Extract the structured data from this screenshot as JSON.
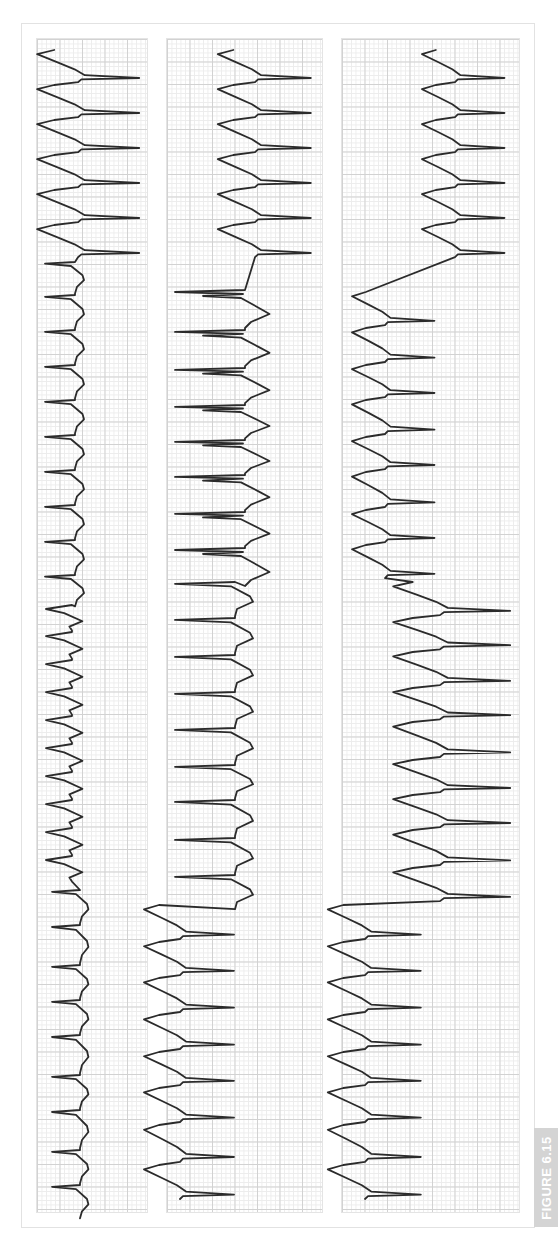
{
  "figure": {
    "label": "FIGURE 6.15",
    "label_bg": "#d4d4d4",
    "trace_color": "#2b2b2b",
    "grid_major_color": "#d2d2d2",
    "grid_minor_color": "#ececec"
  },
  "chart_data": {
    "type": "line",
    "title": "",
    "grid": true,
    "strips": [
      {
        "name": "strip-1",
        "x_range": [
          36,
          148
        ],
        "segments": [
          {
            "shape": "wide-right",
            "base": 78,
            "amp": 68,
            "beats": [
              50,
              85,
              120,
              155,
              190,
              225
            ]
          },
          {
            "shape": "mixed-left",
            "base": 75,
            "amp": -30,
            "beats": [
              262,
              295,
              330,
              365,
              400,
              435,
              470,
              505,
              540,
              575
            ]
          },
          {
            "shape": "small-left",
            "base": 72,
            "amp": -26,
            "beats": [
              605,
              632,
              660,
              688,
              716,
              744,
              772,
              800,
              828,
              856
            ]
          },
          {
            "shape": "narrow-left",
            "base": 80,
            "amp": -28,
            "beats": [
              890,
              925,
              965,
              1000,
              1035,
              1075,
              1110,
              1150,
              1185
            ]
          }
        ]
      },
      {
        "name": "strip-2",
        "x_range": [
          166,
          323
        ],
        "segments": [
          {
            "shape": "wide-right",
            "base": 255,
            "amp": 62,
            "beats": [
              50,
              85,
              120,
              155,
              190,
              225
            ]
          },
          {
            "shape": "burst-left",
            "base": 245,
            "amp": -70,
            "beats": [
              290,
              330,
              368,
              405,
              440,
              475,
              512,
              548
            ]
          },
          {
            "shape": "narrow-left",
            "base": 235,
            "amp": -60,
            "beats": [
              582,
              618,
              655,
              692,
              728,
              765,
              800,
              838,
              875
            ]
          },
          {
            "shape": "wide-right-rev",
            "base": 180,
            "amp": 60,
            "beats": [
              905,
              942,
              978,
              1015,
              1052,
              1088,
              1125,
              1165
            ]
          }
        ]
      },
      {
        "name": "strip-3",
        "x_range": [
          341,
          520
        ],
        "segments": [
          {
            "shape": "wide-right",
            "base": 455,
            "amp": 55,
            "beats": [
              50,
              85,
              120,
              155,
              190,
              225
            ]
          },
          {
            "shape": "wide-right-rev",
            "base": 385,
            "amp": 55,
            "beats": [
              292,
              328,
              365,
              400,
              437,
              472,
              510,
              545
            ]
          },
          {
            "shape": "wide-right-rev",
            "base": 440,
            "amp": 78,
            "beats": [
              582,
              618,
              652,
              688,
              722,
              760,
              795,
              830,
              868
            ]
          },
          {
            "shape": "wide-right-rev",
            "base": 365,
            "amp": 62,
            "beats": [
              905,
              942,
              978,
              1015,
              1052,
              1088,
              1125,
              1165
            ]
          }
        ]
      }
    ]
  }
}
